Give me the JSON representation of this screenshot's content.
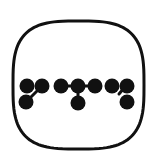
{
  "icon": {
    "name": "connected-dots-logo",
    "label": "",
    "colors": {
      "stroke": "#111111",
      "fill": "#111111",
      "background": "#ffffff"
    },
    "frame": {
      "shape": "squircle",
      "left": 13,
      "top": 21,
      "right": 144,
      "bottom": 149,
      "stroke_width": 3
    },
    "dot_radius": 7.5,
    "dots": [
      {
        "x": 27,
        "y": 86
      },
      {
        "x": 42,
        "y": 86
      },
      {
        "x": 26,
        "y": 102
      },
      {
        "x": 61,
        "y": 86
      },
      {
        "x": 78,
        "y": 86
      },
      {
        "x": 95,
        "y": 86
      },
      {
        "x": 78,
        "y": 103
      },
      {
        "x": 112,
        "y": 86
      },
      {
        "x": 127,
        "y": 86
      },
      {
        "x": 127,
        "y": 102
      }
    ],
    "connectors": [
      {
        "x1": 42,
        "y1": 86,
        "x2": 26,
        "y2": 102
      },
      {
        "x1": 61,
        "y1": 86,
        "x2": 95,
        "y2": 86
      },
      {
        "x1": 78,
        "y1": 86,
        "x2": 78,
        "y2": 103
      },
      {
        "x1": 124,
        "y1": 88,
        "x2": 119,
        "y2": 94
      }
    ]
  }
}
